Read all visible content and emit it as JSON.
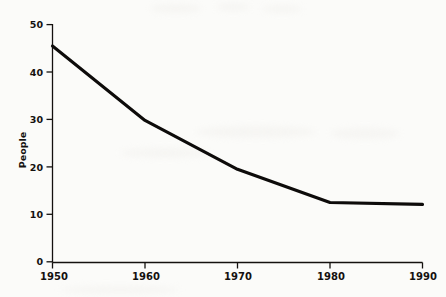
{
  "figure": {
    "background_color": "#fbfbf9",
    "line_color": "#0d0b0a",
    "axis_color": "#14110f"
  },
  "chart_data": {
    "type": "line",
    "title": "",
    "subtitle": "",
    "xlabel": "",
    "ylabel": "People",
    "x": [
      1950,
      1960,
      1970,
      1980,
      1990
    ],
    "xtick_labels": [
      "1950",
      "1960",
      "1970",
      "1980",
      "1990"
    ],
    "ytick_labels": [
      "0",
      "10",
      "20",
      "30",
      "40",
      "50"
    ],
    "yticks": [
      0,
      10,
      20,
      30,
      40,
      50
    ],
    "values": [
      45.5,
      29.8,
      19.5,
      12.5,
      12.1
    ],
    "series": [
      {
        "name": "People",
        "values": [
          45.5,
          29.8,
          19.5,
          12.5,
          12.1
        ]
      }
    ],
    "xlim": [
      1950,
      1990
    ],
    "ylim": [
      0,
      50
    ],
    "grid": false,
    "legend": false,
    "legend_position": "none",
    "annotations": []
  },
  "axes": {
    "y_title": "People",
    "y_ticks": [
      {
        "label": "50",
        "value": 50
      },
      {
        "label": "40",
        "value": 40
      },
      {
        "label": "30",
        "value": 30
      },
      {
        "label": "20",
        "value": 20
      },
      {
        "label": "10",
        "value": 10
      },
      {
        "label": "0",
        "value": 0
      }
    ],
    "x_ticks": [
      {
        "label": "1950",
        "value": 1950
      },
      {
        "label": "1960",
        "value": 1960
      },
      {
        "label": "1970",
        "value": 1970
      },
      {
        "label": "1980",
        "value": 1980
      },
      {
        "label": "1990",
        "value": 1990
      }
    ]
  }
}
